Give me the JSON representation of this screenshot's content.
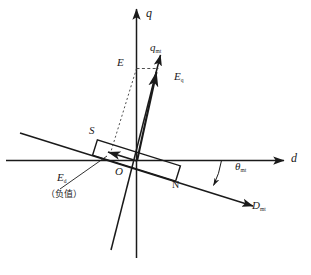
{
  "figure": {
    "type": "vector-phasor-diagram"
  },
  "axes": {
    "d_label": "d",
    "q_label": "q",
    "q_mt_label": "q",
    "q_mt_sub": "mt",
    "d_mt_label": "D",
    "d_mt_sub": "mt",
    "origin_label": "O"
  },
  "vectors": {
    "eq_label": "E",
    "eq_sub": "q",
    "ed_label": "E",
    "ed_sub": "d",
    "e_point_label": "E"
  },
  "angle": {
    "theta_label": "θ",
    "theta_sub": "mt"
  },
  "magnet": {
    "south_label": "S",
    "north_label": "N"
  },
  "annotations": {
    "negative_note": "（负值）"
  },
  "caption": {
    "text": ""
  },
  "colors": {
    "stroke": "#1a1a1a",
    "background": "#ffffff",
    "dashed": "#555555"
  }
}
